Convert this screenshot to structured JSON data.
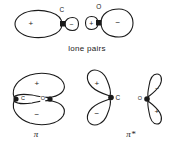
{
  "figure": {
    "caption_lone_pairs": "lone pairs",
    "stroke_color": "#1a1a1a",
    "fill_color": "#ffffff",
    "background_color": "#ffffff"
  },
  "lone_pairs": {
    "caption": "lone pairs",
    "orbitals": [
      {
        "atom": "C",
        "atom_label_x": 61,
        "atom_label_y": 9,
        "nucleus_x": 63,
        "nucleus_y": 24,
        "big_lobe_sign": "+",
        "big_lobe_sign_x": 31,
        "big_lobe_sign_y": 24,
        "small_lobe_sign": "−",
        "small_lobe_sign_x": 71,
        "small_lobe_sign_y": 24,
        "direction": "left"
      },
      {
        "atom": "O",
        "atom_label_x": 98,
        "atom_label_y": 6,
        "nucleus_x": 99,
        "nucleus_y": 23,
        "big_lobe_sign": "−",
        "big_lobe_sign_x": 117,
        "big_lobe_sign_y": 23,
        "small_lobe_sign": "+",
        "small_lobe_sign_x": 92,
        "small_lobe_sign_y": 23,
        "direction": "right"
      }
    ]
  },
  "pi_orbital": {
    "symbol": "π",
    "symbol_x": 36,
    "symbol_y": 132,
    "top_lobe_sign": "+",
    "top_lobe_sign_x": 37,
    "top_lobe_sign_y": 83,
    "bottom_lobe_sign": "−",
    "bottom_lobe_sign_x": 37,
    "bottom_lobe_sign_y": 116,
    "atoms": [
      {
        "label": "C",
        "x": 22,
        "y": 99,
        "nucleus_x": 16,
        "nucleus_y": 99
      },
      {
        "label": "O",
        "x": 44,
        "y": 99,
        "nucleus_x": 50,
        "nucleus_y": 99
      }
    ]
  },
  "pi_star_orbital": {
    "symbol": "π*",
    "symbol_x": 130,
    "symbol_y": 132,
    "carbon": {
      "atom": "C",
      "atom_label_x": 118,
      "atom_label_y": 99,
      "nucleus_x": 111,
      "nucleus_y": 97,
      "top_lobe_sign": "+",
      "top_lobe_sign_x": 97,
      "top_lobe_sign_y": 84,
      "bottom_lobe_sign": "−",
      "bottom_lobe_sign_x": 98,
      "bottom_lobe_sign_y": 115
    },
    "oxygen": {
      "atom": "O",
      "atom_label_x": 141,
      "atom_label_y": 99,
      "nucleus_x": 147,
      "nucleus_y": 99,
      "top_lobe_sign": "−",
      "top_lobe_sign_x": 158,
      "top_lobe_sign_y": 88,
      "bottom_lobe_sign": "+",
      "bottom_lobe_sign_x": 159,
      "bottom_lobe_sign_y": 112
    }
  }
}
